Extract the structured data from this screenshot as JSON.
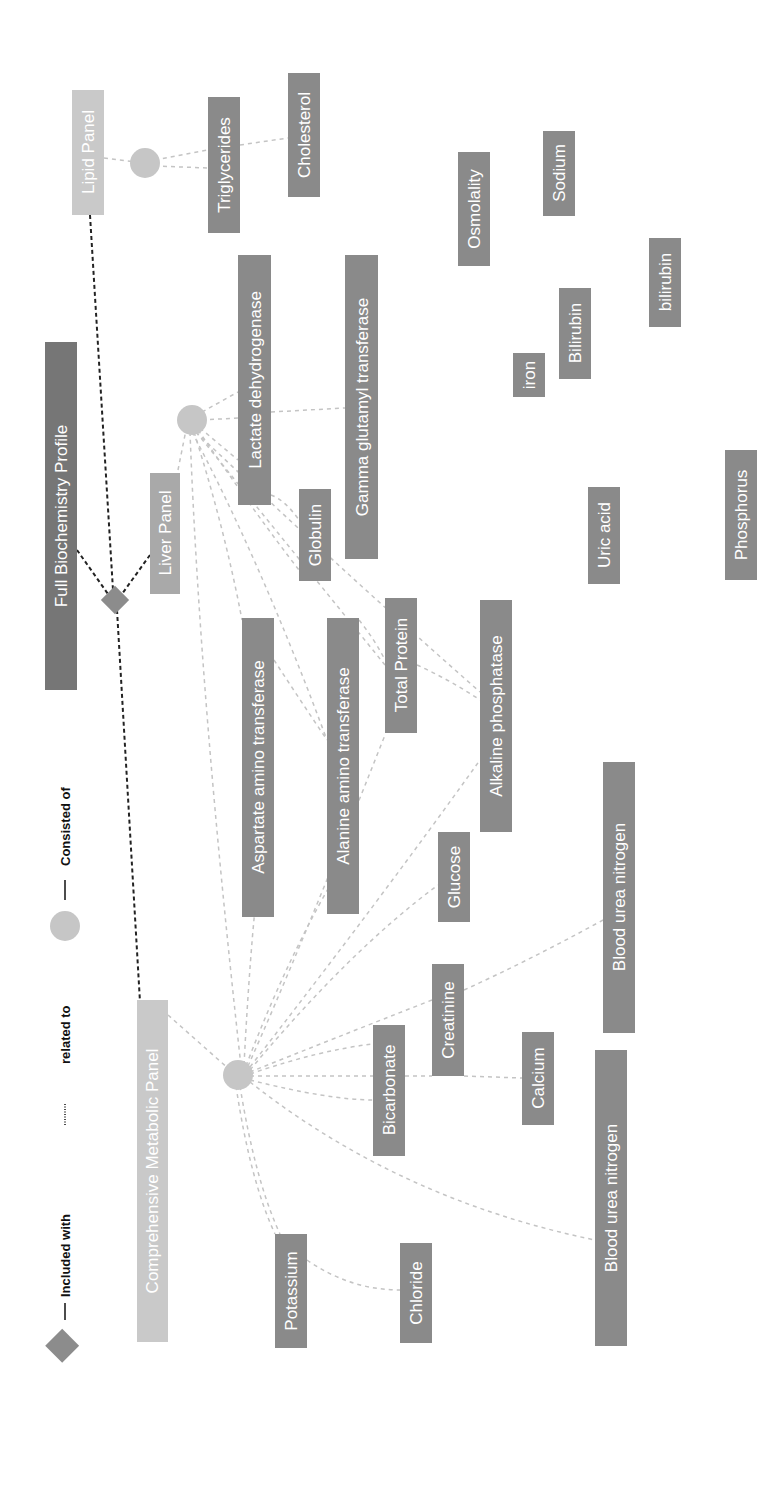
{
  "legend": {
    "included_with": "Included with",
    "related_to": "related to",
    "consisted_of": "Consisted of"
  },
  "colors": {
    "node_fill": "#8a8a8a",
    "light_node_fill": "#c9c9c9",
    "dark_node_fill": "#767676",
    "hub_fill": "#c6c6c6",
    "diamond_fill": "#8c8c8c",
    "related_edge": "#222222",
    "consisted_edge": "#c4c4c4"
  },
  "nodes": {
    "lipid_panel": "Lipid Panel",
    "triglycerides": "Triglycerides",
    "cholesterol": "Cholesterol",
    "full_profile": "Full Biochemistry Profile",
    "liver_panel": "Liver Panel",
    "lactate": "Lactate dehydrogenase",
    "ggt": "Gamma glutamyl transferase",
    "globulin": "Globulin",
    "osmolality": "Osmolality",
    "sodium": "Sodium",
    "iron": "iron",
    "bilirubin_upper": "Bilirubin",
    "bilirubin_lower": "bilirubin",
    "uric_acid": "Uric acid",
    "phosphorus": "Phosphorus",
    "aspartate": "Aspartate amino transferase",
    "alanine": "Alanine amino transferase",
    "total_protein": "Total Protein",
    "alkaline": "Alkaline phosphatase",
    "glucose": "Glucose",
    "cmp": "Comprehensive Metabolic Panel",
    "bicarbonate": "Bicarbonate",
    "creatinine": "Creatinine",
    "calcium": "Calcium",
    "bun_1": "Blood urea nitrogen",
    "bun_2": "Blood urea nitrogen",
    "potassium": "Potassium",
    "chloride": "Chloride"
  }
}
